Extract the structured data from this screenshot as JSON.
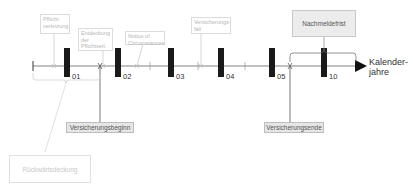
{
  "axis": {
    "label": "Kalender-\njahre"
  },
  "year_markers": [
    {
      "label": "01",
      "x": 67
    },
    {
      "label": "02",
      "x": 118
    },
    {
      "label": "03",
      "x": 171
    },
    {
      "label": "04",
      "x": 221
    },
    {
      "label": "05",
      "x": 272
    },
    {
      "label": "10",
      "x": 324
    }
  ],
  "events": {
    "pflichtverletzung": "Pflicht-\nverletzung",
    "entdeckung": "Entdeckung\nder\nPflichtverl.",
    "notice": "Notice of\nCircumstances",
    "versicherungsfall": "Versicherungs-\nfall"
  },
  "boxes": {
    "versicherungsbeginn": "Versicherungsbeginn",
    "versicherungsende": "Versicherungsende",
    "nachmeldefrist": "Nachmeldefrist",
    "rueckwaertsdeckung": "Rückwärtsdeckung"
  },
  "colors": {
    "axis": "#555555",
    "marker": "#1a1a1a",
    "faint": "#c8c8c8",
    "box_fill": "#e6e6e6"
  }
}
